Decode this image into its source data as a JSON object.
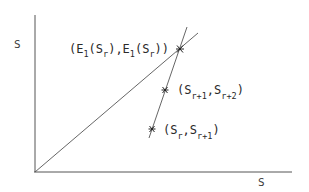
{
  "diagram": {
    "axes": {
      "x_label": "S",
      "y_label": "S",
      "color": "#444444"
    },
    "lines": [
      {
        "name": "identity-line",
        "description": "diagonal from origin"
      },
      {
        "name": "iteration-line",
        "description": "steep line through iterates"
      }
    ],
    "points": [
      {
        "name": "fixed-point",
        "marker": "*",
        "label_parts": [
          "(E",
          "1",
          "(S",
          "r",
          "),E",
          "1",
          "(S",
          "r",
          "))"
        ]
      },
      {
        "name": "point-r1-r2",
        "marker": "*",
        "label_parts": [
          "(S",
          "r+1",
          ",S",
          "r+2",
          ")"
        ]
      },
      {
        "name": "point-r-r1",
        "marker": "*",
        "label_parts": [
          "(S",
          "r",
          ",S",
          "r+1",
          ")"
        ]
      }
    ]
  }
}
